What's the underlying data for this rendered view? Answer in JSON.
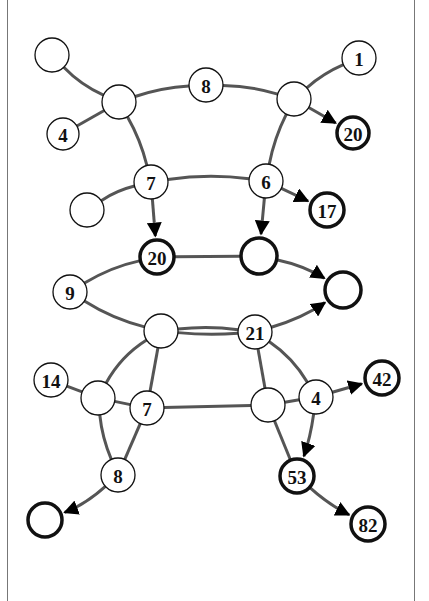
{
  "diagram": {
    "type": "directed-graph",
    "nodes": [
      {
        "id": "A",
        "label": "",
        "x": 52,
        "y": 55,
        "r": 17,
        "bold": false
      },
      {
        "id": "B",
        "label": "",
        "x": 119,
        "y": 102,
        "r": 17,
        "bold": false
      },
      {
        "id": "C",
        "label": "4",
        "x": 63,
        "y": 134,
        "r": 16,
        "bold": false
      },
      {
        "id": "D",
        "label": "8",
        "x": 206,
        "y": 85,
        "r": 17,
        "bold": false
      },
      {
        "id": "E",
        "label": "",
        "x": 294,
        "y": 99,
        "r": 17,
        "bold": false
      },
      {
        "id": "F",
        "label": "1",
        "x": 359,
        "y": 58,
        "r": 17,
        "bold": false
      },
      {
        "id": "G",
        "label": "20",
        "x": 353,
        "y": 133,
        "r": 16,
        "bold": true
      },
      {
        "id": "H",
        "label": "7",
        "x": 151,
        "y": 182,
        "r": 17,
        "bold": false
      },
      {
        "id": "I",
        "label": "",
        "x": 87,
        "y": 210,
        "r": 17,
        "bold": false
      },
      {
        "id": "J",
        "label": "6",
        "x": 266,
        "y": 181,
        "r": 17,
        "bold": false
      },
      {
        "id": "K",
        "label": "17",
        "x": 327,
        "y": 210,
        "r": 17,
        "bold": true
      },
      {
        "id": "L",
        "label": "20",
        "x": 157,
        "y": 257,
        "r": 17,
        "bold": true
      },
      {
        "id": "M",
        "label": "",
        "x": 259,
        "y": 256,
        "r": 18,
        "bold": true
      },
      {
        "id": "N",
        "label": "",
        "x": 343,
        "y": 290,
        "r": 18,
        "bold": true
      },
      {
        "id": "O",
        "label": "9",
        "x": 70,
        "y": 292,
        "r": 17,
        "bold": false
      },
      {
        "id": "P",
        "label": "",
        "x": 161,
        "y": 331,
        "r": 17,
        "bold": false
      },
      {
        "id": "Q",
        "label": "21",
        "x": 255,
        "y": 332,
        "r": 17,
        "bold": false
      },
      {
        "id": "R",
        "label": "14",
        "x": 51,
        "y": 380,
        "r": 17,
        "bold": false
      },
      {
        "id": "S",
        "label": "",
        "x": 98,
        "y": 398,
        "r": 17,
        "bold": false
      },
      {
        "id": "T",
        "label": "7",
        "x": 147,
        "y": 408,
        "r": 17,
        "bold": false
      },
      {
        "id": "U",
        "label": "",
        "x": 268,
        "y": 405,
        "r": 17,
        "bold": false
      },
      {
        "id": "V",
        "label": "4",
        "x": 316,
        "y": 397,
        "r": 17,
        "bold": false
      },
      {
        "id": "W",
        "label": "42",
        "x": 382,
        "y": 378,
        "r": 17,
        "bold": true
      },
      {
        "id": "X",
        "label": "8",
        "x": 118,
        "y": 475,
        "r": 17,
        "bold": false
      },
      {
        "id": "Y",
        "label": "",
        "x": 45,
        "y": 520,
        "r": 17,
        "bold": true
      },
      {
        "id": "Z",
        "label": "53",
        "x": 297,
        "y": 476,
        "r": 17,
        "bold": true
      },
      {
        "id": "AA",
        "label": "82",
        "x": 368,
        "y": 524,
        "r": 17,
        "bold": true
      }
    ],
    "edges": [
      {
        "from": "A",
        "to": "B",
        "curve": 8,
        "arrow": false
      },
      {
        "from": "C",
        "to": "B",
        "curve": 0,
        "arrow": false
      },
      {
        "from": "B",
        "to": "D",
        "curve": -6,
        "arrow": false
      },
      {
        "from": "D",
        "to": "E",
        "curve": -6,
        "arrow": false
      },
      {
        "from": "E",
        "to": "F",
        "curve": -6,
        "arrow": false
      },
      {
        "from": "E",
        "to": "G",
        "curve": 0,
        "arrow": true
      },
      {
        "from": "B",
        "to": "H",
        "curve": -6,
        "arrow": false
      },
      {
        "from": "E",
        "to": "J",
        "curve": 6,
        "arrow": false
      },
      {
        "from": "I",
        "to": "H",
        "curve": -6,
        "arrow": false
      },
      {
        "from": "H",
        "to": "J",
        "curve": -8,
        "arrow": false
      },
      {
        "from": "J",
        "to": "K",
        "curve": 0,
        "arrow": true
      },
      {
        "from": "H",
        "to": "L",
        "curve": 0,
        "arrow": true
      },
      {
        "from": "J",
        "to": "M",
        "curve": 0,
        "arrow": true
      },
      {
        "from": "O",
        "to": "L",
        "curve": -8,
        "arrow": false
      },
      {
        "from": "L",
        "to": "M",
        "curve": 0,
        "arrow": false
      },
      {
        "from": "M",
        "to": "N",
        "curve": -8,
        "arrow": true
      },
      {
        "from": "O",
        "to": "P",
        "curve": 8,
        "arrow": false
      },
      {
        "from": "P",
        "to": "Q",
        "curve": -6,
        "arrow": false
      },
      {
        "from": "P",
        "to": "Q",
        "curve": 4,
        "arrow": false
      },
      {
        "from": "Q",
        "to": "N",
        "curve": 8,
        "arrow": true
      },
      {
        "from": "P",
        "to": "S",
        "curve": 12,
        "arrow": false
      },
      {
        "from": "P",
        "to": "T",
        "curve": 0,
        "arrow": false
      },
      {
        "from": "Q",
        "to": "U",
        "curve": 0,
        "arrow": false
      },
      {
        "from": "Q",
        "to": "V",
        "curve": -10,
        "arrow": false
      },
      {
        "from": "R",
        "to": "S",
        "curve": 0,
        "arrow": false
      },
      {
        "from": "S",
        "to": "T",
        "curve": 0,
        "arrow": false
      },
      {
        "from": "T",
        "to": "U",
        "curve": 0,
        "arrow": false
      },
      {
        "from": "U",
        "to": "V",
        "curve": 0,
        "arrow": false
      },
      {
        "from": "V",
        "to": "W",
        "curve": 0,
        "arrow": true
      },
      {
        "from": "V",
        "to": "Z",
        "curve": -4,
        "arrow": true
      },
      {
        "from": "S",
        "to": "X",
        "curve": 6,
        "arrow": false
      },
      {
        "from": "T",
        "to": "X",
        "curve": 0,
        "arrow": false
      },
      {
        "from": "X",
        "to": "Y",
        "curve": -8,
        "arrow": true
      },
      {
        "from": "U",
        "to": "Z",
        "curve": 0,
        "arrow": false
      },
      {
        "from": "Z",
        "to": "AA",
        "curve": 6,
        "arrow": true
      }
    ],
    "colors": {
      "edge": "#555555",
      "node_stroke": "#111111",
      "node_fill": "#ffffff",
      "frame": "#777777"
    }
  }
}
